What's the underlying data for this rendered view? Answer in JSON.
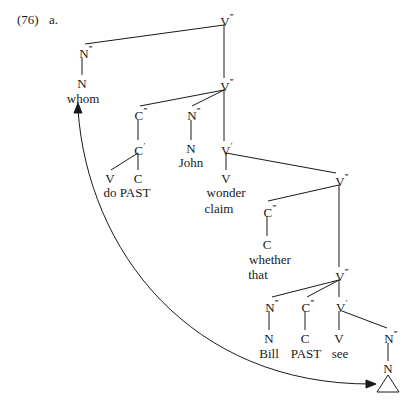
{
  "example": {
    "number": "(76)",
    "letter": "a."
  },
  "nodes": {
    "root_v3": {
      "cat": "V",
      "bar": "‴"
    },
    "whom_n3": {
      "cat": "N",
      "bar": "‴"
    },
    "whom_n": {
      "cat": "N",
      "bar": ""
    },
    "whom_word": "whom",
    "v3_second": {
      "cat": "V",
      "bar": "‴"
    },
    "c3_do": {
      "cat": "C",
      "bar": "‴"
    },
    "c1_do": {
      "cat": "C",
      "bar": "′"
    },
    "v_do": {
      "cat": "V",
      "bar": ""
    },
    "c_past": {
      "cat": "C",
      "bar": ""
    },
    "do_past_word": "do PAST",
    "john_n3": {
      "cat": "N",
      "bar": "‴"
    },
    "john_n": {
      "cat": "N",
      "bar": ""
    },
    "john_word": "John",
    "v1_wonder": {
      "cat": "V",
      "bar": "′"
    },
    "v_wonder": {
      "cat": "V",
      "bar": ""
    },
    "wonder_word": "wonder",
    "claim_word": "claim",
    "v3_embedded": {
      "cat": "V",
      "bar": "‴"
    },
    "c3_whether": {
      "cat": "C",
      "bar": "‴"
    },
    "c_whether": {
      "cat": "C",
      "bar": ""
    },
    "whether_word": "whether",
    "that_word": "that",
    "v3_lowest": {
      "cat": "V",
      "bar": "‴"
    },
    "bill_n3": {
      "cat": "N",
      "bar": "‴"
    },
    "bill_n": {
      "cat": "N",
      "bar": ""
    },
    "bill_word": "Bill",
    "past_c3": {
      "cat": "C",
      "bar": "‴"
    },
    "past_c": {
      "cat": "C",
      "bar": ""
    },
    "past_word": "PAST",
    "see_v1": {
      "cat": "V",
      "bar": "′"
    },
    "see_v": {
      "cat": "V",
      "bar": ""
    },
    "see_word": "see",
    "obj_n3": {
      "cat": "N",
      "bar": "‴"
    },
    "obj_n": {
      "cat": "N",
      "bar": ""
    },
    "trace_symbol": "triangle"
  },
  "movement_arrow": {
    "from": "object trace (triangle)",
    "to": "whom",
    "style": "curved double-headed arrow"
  }
}
